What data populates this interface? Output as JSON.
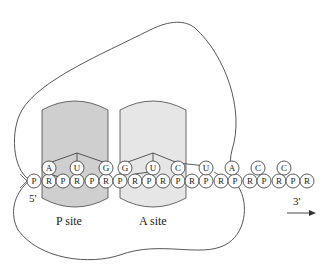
{
  "diagram": {
    "type": "ribosome-translation-schematic",
    "colors": {
      "outline": "#444444",
      "p_site_fill": "#cfcfcf",
      "a_site_fill": "#e6e6e6",
      "circle_fill": "#ffffff"
    },
    "sites": [
      {
        "id": "p-site",
        "label": "P site"
      },
      {
        "id": "a-site",
        "label": "A site"
      }
    ],
    "ends": {
      "five_prime": "5'",
      "three_prime": "3'"
    },
    "backbone": [
      "P",
      "R",
      "P",
      "R",
      "P",
      "R",
      "P",
      "R",
      "P",
      "R",
      "P",
      "R",
      "P",
      "R",
      "P",
      "R",
      "P",
      "R",
      "P",
      "R",
      "P"
    ],
    "bases": [
      "A",
      "U",
      "G",
      "G",
      "U",
      "C",
      "U",
      "A",
      "C",
      "C"
    ],
    "codons": [
      {
        "site": "P site",
        "bases": [
          "A",
          "U",
          "G"
        ]
      },
      {
        "site": "A site",
        "bases": [
          "G",
          "U",
          "C"
        ]
      }
    ]
  }
}
